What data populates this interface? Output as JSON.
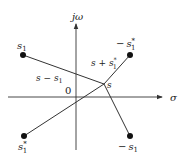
{
  "diagram": {
    "title": "",
    "axes": {
      "vertical_label": "jω",
      "horizontal_label": "σ",
      "origin_label": "0"
    },
    "point_s": {
      "label": "s",
      "x": 104,
      "y": 84
    },
    "points": [
      {
        "id": "s1",
        "label": "s",
        "sub": "1",
        "sup": "",
        "prefix": "",
        "x": 23,
        "y": 55
      },
      {
        "id": "neg-s1-conj",
        "label": "s",
        "sub": "1",
        "sup": "*",
        "prefix": "−",
        "x": 130,
        "y": 55
      },
      {
        "id": "s1-conj",
        "label": "s",
        "sub": "1",
        "sup": "*",
        "prefix": "",
        "x": 24,
        "y": 136
      },
      {
        "id": "neg-s1",
        "label": "s",
        "sub": "1",
        "sup": "",
        "prefix": "−",
        "x": 130,
        "y": 136
      }
    ],
    "vector_labels": {
      "s_minus_s1": {
        "main": "s − s",
        "sub": "1"
      },
      "s_plus_s1_conj": {
        "main": "s + s",
        "sub": "1",
        "sup": "*"
      }
    },
    "colors": {
      "line": "#333333",
      "dot": "#111111",
      "axis": "#333333"
    }
  }
}
